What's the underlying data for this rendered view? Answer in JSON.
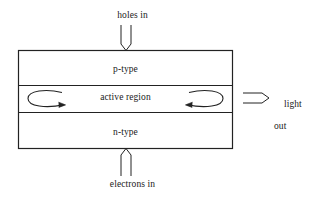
{
  "diagram": {
    "stroke_color": "#222222",
    "background_color": "#ffffff",
    "layers": [
      {
        "id": "p-type",
        "label": "p-type"
      },
      {
        "id": "active-region",
        "label": "active region"
      },
      {
        "id": "n-type",
        "label": "n-type"
      }
    ],
    "annotations": {
      "top_inflow": "holes in",
      "bottom_inflow": "electrons in",
      "output_line1": "light",
      "output_line2": "out"
    },
    "arrows": [
      {
        "id": "holes-in-arrow",
        "direction": "down",
        "style": "hollow-double-line"
      },
      {
        "id": "electrons-in-arrow",
        "direction": "up",
        "style": "hollow-double-line"
      },
      {
        "id": "light-out-arrow",
        "direction": "right",
        "style": "hollow-double-line"
      },
      {
        "id": "left-recirculation-arrow",
        "direction": "clockwise-right",
        "style": "curved-loop"
      },
      {
        "id": "right-recirculation-arrow",
        "direction": "counterclockwise-left",
        "style": "curved-loop"
      }
    ]
  }
}
